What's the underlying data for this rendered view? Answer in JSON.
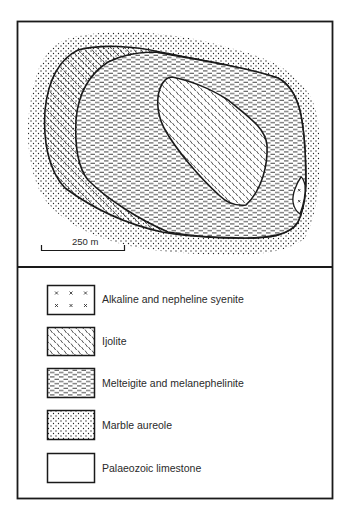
{
  "figure": {
    "type": "geological-map",
    "scale_bar": {
      "label": "250 m"
    },
    "units": [
      {
        "id": "syenite",
        "name": "Alkaline and nepheline syenite",
        "pattern": "crosses"
      },
      {
        "id": "ijolite",
        "name": "Ijolite",
        "pattern": "diagonal-dashes"
      },
      {
        "id": "melteigite",
        "name": "Melteigite and melanephelinite",
        "pattern": "horizontal-dashes"
      },
      {
        "id": "marble",
        "name": "Marble aureole",
        "pattern": "stipple"
      },
      {
        "id": "limestone",
        "name": "Palaeozoic limestone",
        "pattern": "blank"
      }
    ]
  },
  "legend": {
    "items": [
      {
        "label": "Alkaline and nepheline syenite"
      },
      {
        "label": "Ijolite"
      },
      {
        "label": "Melteigite and melanephelinite"
      },
      {
        "label": "Marble aureole"
      },
      {
        "label": "Palaeozoic limestone"
      }
    ]
  },
  "colors": {
    "ink": "#1a1a1a",
    "background": "#ffffff"
  }
}
